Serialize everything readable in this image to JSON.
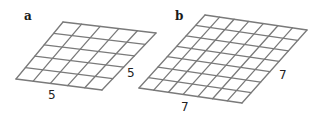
{
  "figure": {
    "background": "#ffffff",
    "line_color": "#7a7a7a",
    "panels": [
      {
        "label": "a",
        "label_pos": [
          24,
          20
        ],
        "grid_size": 5,
        "corners": {
          "top_left": [
            63,
            22
          ],
          "top_right": [
            156,
            33
          ],
          "bottom_right": [
            102,
            90
          ],
          "bottom_left": [
            16,
            79
          ]
        },
        "dimension_labels": [
          {
            "text": "5",
            "pos": [
              127,
              77
            ],
            "side": "right"
          },
          {
            "text": "5",
            "pos": [
              48,
              99
            ],
            "side": "bottom"
          }
        ]
      },
      {
        "label": "b",
        "label_pos": [
          175,
          20
        ],
        "grid_size": 7,
        "corners": {
          "top_left": [
            205,
            15
          ],
          "top_right": [
            307,
            30
          ],
          "bottom_right": [
            242,
            103
          ],
          "bottom_left": [
            139,
            88
          ]
        },
        "dimension_labels": [
          {
            "text": "7",
            "pos": [
              279,
              79
            ],
            "side": "right"
          },
          {
            "text": "7",
            "pos": [
              181,
              111
            ],
            "side": "bottom"
          }
        ]
      }
    ]
  }
}
